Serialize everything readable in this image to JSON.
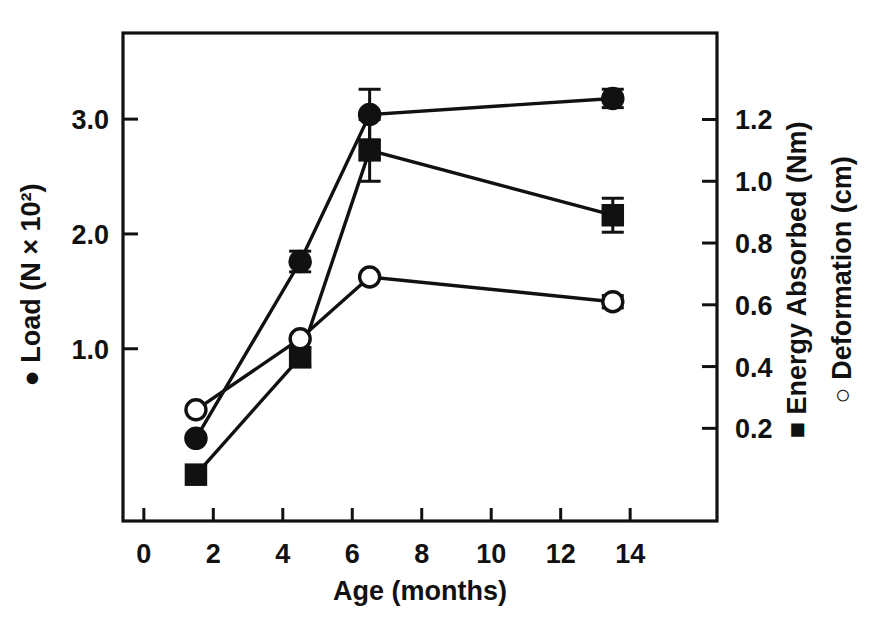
{
  "chart_data": {
    "type": "line",
    "title": "",
    "subtitle": "",
    "xlabel": "Age (months)",
    "ylabel_left": "● Load (N × 10²)",
    "ylabel_right_1": "■ Energy Absorbed (Nm)",
    "ylabel_right_2": "○ Deformation (cm)",
    "grid": false,
    "legend_position": "axis-labels",
    "x": [
      1.5,
      4.5,
      6.5,
      13.5
    ],
    "xlim": [
      -0.6,
      16.5
    ],
    "xticks": [
      0,
      2,
      4,
      6,
      8,
      10,
      12,
      14
    ],
    "xticklabels": [
      "0",
      "2",
      "4",
      "6",
      "8",
      "10",
      "12",
      "14"
    ],
    "ylim_left": [
      -0.5,
      3.75
    ],
    "yticks_left": [
      1.0,
      2.0,
      3.0
    ],
    "yticklabels_left": [
      "1.0",
      "2.0",
      "3.0"
    ],
    "ylim_right": [
      -0.1,
      1.48
    ],
    "yticks_right": [
      0.2,
      0.4,
      0.6,
      0.8,
      1.0,
      1.2
    ],
    "yticklabels_right": [
      "0.2",
      "0.4",
      "0.6",
      "0.8",
      "1.0",
      "1.2"
    ],
    "series": [
      {
        "name": "Load",
        "marker": "filled-circle",
        "axis": "left",
        "unit": "N × 10²",
        "values": [
          0.22,
          1.76,
          3.04,
          3.18
        ],
        "errors": [
          0.0,
          0.09,
          0.22,
          0.08
        ]
      },
      {
        "name": "Energy Absorbed",
        "marker": "filled-square",
        "axis": "right",
        "unit": "Nm",
        "values": [
          0.05,
          0.43,
          1.1,
          0.89
        ],
        "errors": [
          0.0,
          0.03,
          0.1,
          0.055
        ]
      },
      {
        "name": "Deformation",
        "marker": "open-circle",
        "axis": "right",
        "unit": "cm",
        "values": [
          0.26,
          0.49,
          0.69,
          0.61
        ],
        "errors": [
          0.0,
          0.0,
          0.0,
          0.02
        ]
      }
    ]
  },
  "axis_titles": {
    "x": "Age (months)",
    "left": "Load (N × 10²)",
    "right_energy": "Energy Absorbed (Nm)",
    "right_deformation": "Deformation (cm)"
  },
  "colors": {
    "ink": "#111111",
    "background": "#ffffff"
  }
}
